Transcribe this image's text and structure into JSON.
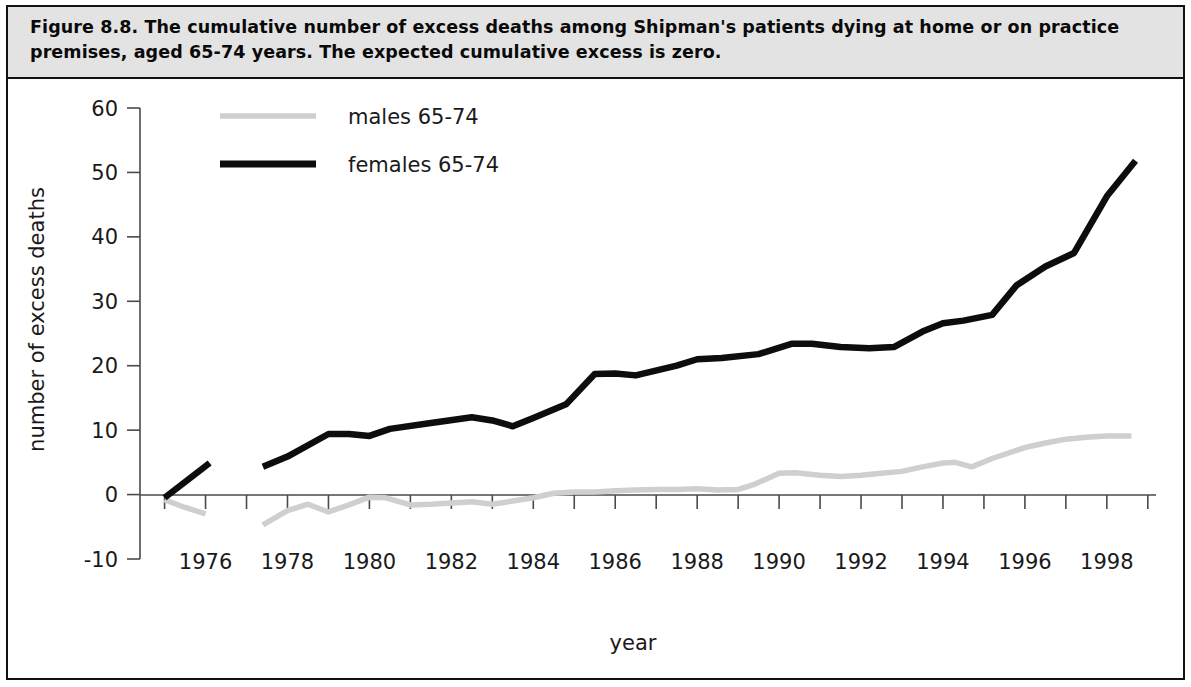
{
  "figure": {
    "caption": "Figure 8.8. The cumulative number of excess deaths among Shipman's patients dying at home or on practice premises, aged 65-74 years. The expected cumulative excess is zero."
  },
  "colors": {
    "caption_background": "#e3e3e3",
    "frame": "#111111",
    "female_series": "#0d0d0d",
    "male_series": "#cfcfcf",
    "axis": "#4a4a4a",
    "text": "#1a1a1a"
  },
  "chart_data": {
    "type": "line",
    "title": "",
    "xlabel": "year",
    "ylabel": "number of excess deaths",
    "xlim": [
      1974.4,
      1999.2
    ],
    "ylim": [
      -10,
      60
    ],
    "yticks": [
      -10,
      0,
      10,
      20,
      30,
      40,
      50,
      60
    ],
    "ytick_labels": [
      "-10",
      "0",
      "10",
      "20",
      "30",
      "40",
      "50",
      "60"
    ],
    "xticks": [
      1975,
      1976,
      1977,
      1978,
      1979,
      1980,
      1981,
      1982,
      1983,
      1984,
      1985,
      1986,
      1987,
      1988,
      1989,
      1990,
      1991,
      1992,
      1993,
      1994,
      1995,
      1996,
      1997,
      1998,
      1999
    ],
    "xtick_labels": [
      "1976",
      "1978",
      "1980",
      "1982",
      "1984",
      "1986",
      "1988",
      "1990",
      "1992",
      "1994",
      "1996",
      "1998"
    ],
    "xtick_label_values": [
      1976,
      1978,
      1980,
      1982,
      1984,
      1986,
      1988,
      1990,
      1992,
      1994,
      1996,
      1998
    ],
    "grid": false,
    "legend_position": "top-left-inside",
    "series": [
      {
        "name": "males 65-74",
        "color": "#cfcfcf",
        "segments": [
          {
            "x": [
              1975.0,
              1975.5,
              1976.0
            ],
            "y": [
              -0.8,
              -2.0,
              -3.0
            ]
          },
          {
            "x": [
              1977.4,
              1978.0,
              1978.5,
              1979.0,
              1979.5,
              1980.0,
              1980.4,
              1981.0,
              1981.5,
              1982.0,
              1982.5,
              1983.0,
              1983.5,
              1984.0,
              1984.5,
              1985.0,
              1985.5,
              1986.0,
              1986.5,
              1987.0,
              1987.5,
              1988.0,
              1988.5,
              1989.0,
              1989.4,
              1990.0,
              1990.4,
              1991.0,
              1991.5,
              1992.0,
              1992.5,
              1993.0,
              1993.5,
              1994.0,
              1994.3,
              1994.7,
              1995.2,
              1996.0,
              1996.5,
              1997.0,
              1997.5,
              1998.0,
              1998.6
            ],
            "y": [
              -4.7,
              -2.5,
              -1.5,
              -2.7,
              -1.6,
              -0.4,
              -0.5,
              -1.6,
              -1.5,
              -1.3,
              -1.1,
              -1.5,
              -1.0,
              -0.5,
              0.2,
              0.4,
              0.4,
              0.6,
              0.7,
              0.8,
              0.8,
              0.9,
              0.7,
              0.8,
              1.6,
              3.3,
              3.4,
              3.0,
              2.8,
              3.0,
              3.3,
              3.6,
              4.3,
              4.9,
              5.0,
              4.3,
              5.6,
              7.3,
              8.0,
              8.6,
              8.9,
              9.1,
              9.1
            ]
          }
        ]
      },
      {
        "name": "females 65-74",
        "color": "#0d0d0d",
        "segments": [
          {
            "x": [
              1975.0,
              1976.1
            ],
            "y": [
              -0.5,
              4.9
            ]
          },
          {
            "x": [
              1977.4,
              1978.0,
              1979.0,
              1979.5,
              1980.0,
              1980.5,
              1981.5,
              1982.5,
              1983.0,
              1983.5,
              1984.0,
              1984.8,
              1985.5,
              1986.0,
              1986.5,
              1987.5,
              1988.0,
              1988.6,
              1989.5,
              1990.3,
              1990.8,
              1991.5,
              1992.2,
              1992.8,
              1993.5,
              1994.0,
              1994.5,
              1995.2,
              1995.8,
              1996.5,
              1997.2,
              1998.0,
              1998.7
            ],
            "y": [
              4.3,
              5.9,
              9.4,
              9.4,
              9.1,
              10.2,
              11.1,
              12.0,
              11.5,
              10.6,
              11.9,
              14.0,
              18.7,
              18.8,
              18.5,
              20.0,
              21.0,
              21.2,
              21.8,
              23.4,
              23.4,
              22.9,
              22.7,
              22.9,
              25.3,
              26.6,
              27.0,
              27.9,
              32.5,
              35.4,
              37.5,
              46.3,
              51.8
            ]
          }
        ]
      }
    ]
  },
  "legend": {
    "entries": [
      {
        "label": "males 65-74"
      },
      {
        "label": "females 65-74"
      }
    ]
  }
}
